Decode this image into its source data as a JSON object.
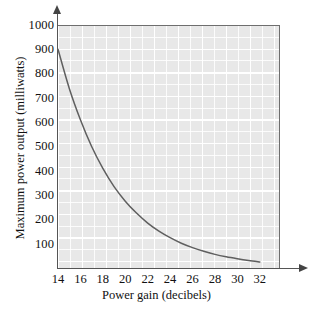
{
  "chart_data": {
    "type": "line",
    "title": "",
    "xlabel": "Power gain (decibels)",
    "ylabel": "Maximum power output (milliwatts)",
    "xlim": [
      14,
      33.8
    ],
    "ylim": [
      0,
      1000
    ],
    "xticks": [
      14,
      16,
      18,
      20,
      22,
      24,
      26,
      28,
      30,
      32
    ],
    "yticks": [
      100,
      200,
      300,
      400,
      500,
      600,
      700,
      800,
      900,
      1000
    ],
    "xtick_labels": [
      "14",
      "16",
      "18",
      "20",
      "22",
      "24",
      "26",
      "28",
      "30",
      "32"
    ],
    "ytick_labels": [
      "100",
      "200",
      "300",
      "400",
      "500",
      "600",
      "700",
      "800",
      "900",
      "1000"
    ],
    "grid": true,
    "grid_color": "#ffffff",
    "panel_color": "#e8e8e8",
    "legend": null,
    "series": [
      {
        "name": "Maximum power output",
        "color": "#5f5f5f",
        "x": [
          14,
          15,
          16,
          17,
          18,
          19,
          20,
          21,
          22,
          23,
          24,
          25,
          26,
          27,
          28,
          29,
          30,
          31,
          32
        ],
        "values": [
          900,
          740,
          610,
          500,
          410,
          335,
          275,
          226,
          185,
          152,
          125,
          102,
          84,
          69,
          56,
          46,
          38,
          31,
          25
        ]
      }
    ]
  },
  "axes": {
    "x_arrow": "arrow-right",
    "y_arrow": "arrow-up"
  }
}
